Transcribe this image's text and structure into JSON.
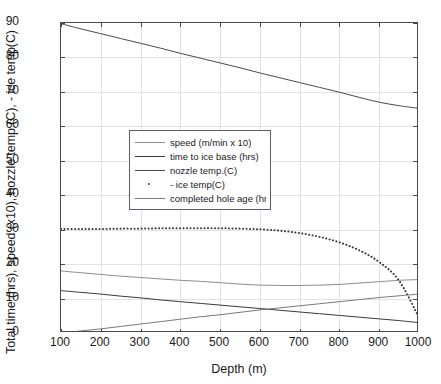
{
  "chart_data": {
    "type": "line",
    "title": "",
    "xlabel": "Depth (m)",
    "ylabel": "Total time (hrs), speed (x10), nozzle temp.(C), - ice temp(C)",
    "xlim": [
      100,
      1000
    ],
    "ylim": [
      0,
      90
    ],
    "xticks": [
      100,
      200,
      300,
      400,
      500,
      600,
      700,
      800,
      900,
      1000
    ],
    "yticks": [
      0,
      10,
      20,
      30,
      40,
      50,
      60,
      70,
      80,
      90
    ],
    "xticklabels": [
      "100",
      "200",
      "300",
      "400",
      "500",
      "600",
      "700",
      "800",
      "900",
      "1000"
    ],
    "yticklabels": [
      "0",
      "10",
      "20",
      "30",
      "40",
      "50",
      "60",
      "70",
      "80",
      "90"
    ],
    "grid": true,
    "legend_position": "upper left",
    "x": [
      100,
      150,
      200,
      250,
      300,
      350,
      400,
      450,
      500,
      550,
      600,
      650,
      700,
      750,
      800,
      850,
      900,
      950,
      1000
    ],
    "series": [
      {
        "name": "speed (m/min x 10)",
        "style": "solid",
        "color": "#8c8c8c",
        "values": [
          18.0,
          17.5,
          17.0,
          16.5,
          16.1,
          15.7,
          15.3,
          15.0,
          14.6,
          14.2,
          13.9,
          13.8,
          13.8,
          13.9,
          14.1,
          14.5,
          14.9,
          15.3,
          15.5
        ]
      },
      {
        "name": "time to ice base (hrs)",
        "style": "solid",
        "color": "#3a3a3a",
        "values": [
          12.3,
          11.8,
          11.3,
          10.7,
          10.2,
          9.6,
          9.1,
          8.6,
          8.1,
          7.6,
          7.1,
          6.6,
          6.1,
          5.6,
          5.1,
          4.6,
          4.1,
          3.6,
          3.0
        ]
      },
      {
        "name": "nozzle temp.(C)",
        "style": "solid",
        "color": "#4a4a4a",
        "values": [
          89.8,
          88.3,
          86.9,
          85.5,
          84.1,
          82.7,
          81.2,
          79.8,
          78.4,
          77.0,
          75.5,
          74.1,
          72.7,
          71.3,
          69.9,
          68.4,
          67.0,
          66.0,
          65.2
        ]
      },
      {
        "name": "- ice temp(C)",
        "style": "dotted",
        "color": "#3a3a3a",
        "values": [
          30.2,
          30.2,
          30.2,
          30.3,
          30.3,
          30.4,
          30.4,
          30.4,
          30.4,
          30.3,
          30.1,
          29.7,
          29.0,
          27.9,
          26.3,
          24.0,
          20.6,
          15.2,
          4.5
        ]
      },
      {
        "name": "completed hole age (hrs)",
        "style": "solid",
        "color": "#7a7a7a",
        "values": [
          0.0,
          0.6,
          1.2,
          1.9,
          2.6,
          3.3,
          4.0,
          4.7,
          5.3,
          6.0,
          6.7,
          7.3,
          7.9,
          8.5,
          9.1,
          9.7,
          10.3,
          10.8,
          11.3
        ]
      }
    ]
  },
  "colors": {
    "axis": "#4a4a4a",
    "grid": "#e2e2e2",
    "legend_border": "#5a5a6e",
    "background": "#ffffff",
    "text": "#1a1a1a"
  }
}
